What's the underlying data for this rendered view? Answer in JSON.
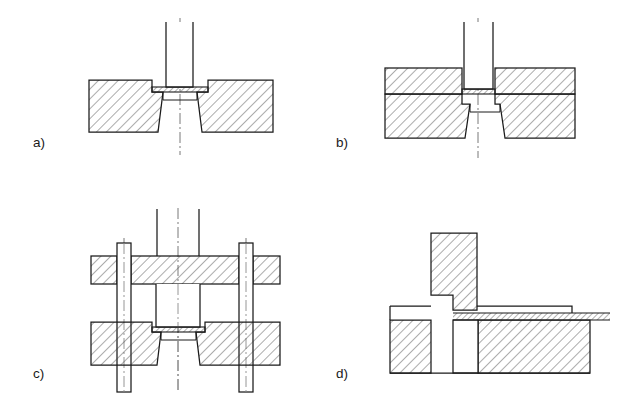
{
  "figure": {
    "background_color": "#ffffff",
    "line_color": "#1a1a1a",
    "hatch_color": "#3a3a3a",
    "centerline_color": "#555555",
    "panels": [
      {
        "id": "a",
        "label": "a)",
        "label_x": 33,
        "label_y": 147,
        "caption": "Open blanking die: punch and die only",
        "components": [
          {
            "name": "punch",
            "hatched": false
          },
          {
            "name": "sheet-blank",
            "hatched": true
          },
          {
            "name": "die-block",
            "hatched": true
          },
          {
            "name": "centerline",
            "hatched": false
          }
        ]
      },
      {
        "id": "b",
        "label": "b)",
        "label_x": 336,
        "label_y": 147,
        "caption": "Die with blank holder / stripper plate above sheet",
        "components": [
          {
            "name": "punch",
            "hatched": false
          },
          {
            "name": "blank-holder",
            "hatched": true
          },
          {
            "name": "sheet-blank",
            "hatched": true
          },
          {
            "name": "die-block",
            "hatched": true
          },
          {
            "name": "centerline",
            "hatched": false
          }
        ]
      },
      {
        "id": "c",
        "label": "c)",
        "label_x": 33,
        "label_y": 378,
        "caption": "Pillar die set with guide posts and top bolster",
        "components": [
          {
            "name": "punch-shank",
            "hatched": false
          },
          {
            "name": "top-bolster",
            "hatched": true
          },
          {
            "name": "guide-post-left",
            "hatched": false
          },
          {
            "name": "guide-post-right",
            "hatched": false
          },
          {
            "name": "punch",
            "hatched": false
          },
          {
            "name": "sheet-blank",
            "hatched": true
          },
          {
            "name": "die-block",
            "hatched": true
          },
          {
            "name": "centerline",
            "hatched": false
          }
        ]
      },
      {
        "id": "d",
        "label": "d)",
        "label_x": 336,
        "label_y": 378,
        "caption": "Progressive/side-feed die with strip fed from the right",
        "components": [
          {
            "name": "punch",
            "hatched": true
          },
          {
            "name": "strip-feed",
            "hatched": true
          },
          {
            "name": "stripper-plate",
            "hatched": false
          },
          {
            "name": "die-block",
            "hatched": true
          },
          {
            "name": "slug-cavity",
            "hatched": false
          }
        ]
      }
    ]
  }
}
